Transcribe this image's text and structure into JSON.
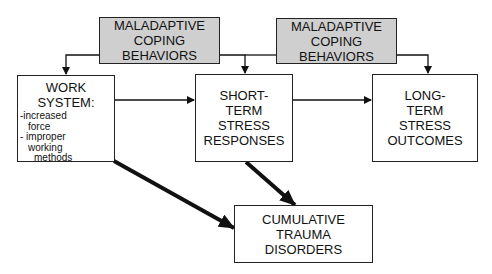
{
  "diagram": {
    "nodes": {
      "coping_left": {
        "lines": [
          "MALADAPTIVE",
          "COPING",
          "BEHAVIORS"
        ],
        "fill": "#cfcfcf"
      },
      "coping_right": {
        "lines": [
          "MALADAPTIVE",
          "COPING",
          "BEHAVIORS"
        ],
        "fill": "#cfcfcf"
      },
      "work_system": {
        "title_lines": [
          "WORK",
          "SYSTEM:"
        ],
        "items": [
          "-increased",
          "  force",
          "- improper",
          "  working",
          "    methods"
        ]
      },
      "short_term": {
        "lines": [
          "SHORT-",
          "TERM",
          "STRESS",
          "RESPONSES"
        ]
      },
      "long_term": {
        "lines": [
          "LONG-",
          "TERM",
          "STRESS",
          "OUTCOMES"
        ]
      },
      "ctd": {
        "lines": [
          "CUMULATIVE",
          "TRAUMA",
          "DISORDERS"
        ]
      }
    },
    "edges": [
      {
        "from": "coping_left",
        "to": "work_system",
        "weight": "thin"
      },
      {
        "from": "coping_left",
        "to": "short_term",
        "weight": "thin"
      },
      {
        "from": "coping_right",
        "to": "short_term",
        "weight": "thin"
      },
      {
        "from": "coping_right",
        "to": "long_term",
        "weight": "thin"
      },
      {
        "from": "work_system",
        "to": "short_term",
        "weight": "thin"
      },
      {
        "from": "short_term",
        "to": "long_term",
        "weight": "thin"
      },
      {
        "from": "work_system",
        "to": "ctd",
        "weight": "thick"
      },
      {
        "from": "short_term",
        "to": "ctd",
        "weight": "thick"
      }
    ]
  }
}
